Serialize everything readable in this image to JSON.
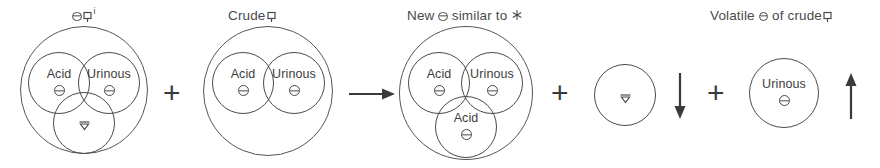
{
  "diagram": {
    "title_text": "Alchemical reaction of acid and urinous salts",
    "stroke_color": "#4a4a4a",
    "text_color": "#3c3c3c",
    "background": "#ffffff",
    "captions": [
      {
        "id": "caption-1",
        "prefix": "",
        "glyphs": "salt retort",
        "suffix": "",
        "superscript": "i",
        "text": ""
      },
      {
        "id": "caption-2",
        "prefix": "Crude",
        "glyphs": "retort",
        "suffix": "",
        "superscript": "",
        "text": "Crude"
      },
      {
        "id": "caption-3",
        "prefix": "New",
        "glyphs": "salt",
        "suffix": "similar to",
        "superscript": "",
        "text": "New  similar to"
      },
      {
        "id": "caption-4",
        "prefix": "Volatile",
        "glyphs": "salt",
        "suffix": "of crude",
        "superscript": "",
        "text": "Volatile  of crude"
      }
    ],
    "groups": [
      {
        "id": "group-1",
        "caption_id": "caption-1",
        "circles": [
          {
            "label": "Acid",
            "glyph": "salt"
          },
          {
            "label": "Urinous",
            "glyph": "salt"
          },
          {
            "label": "",
            "glyph": "vinegar"
          }
        ]
      },
      {
        "id": "group-2",
        "caption_id": "caption-2",
        "circles": [
          {
            "label": "Acid",
            "glyph": "salt"
          },
          {
            "label": "Urinous",
            "glyph": "salt"
          }
        ]
      },
      {
        "id": "group-3",
        "caption_id": "caption-3",
        "circles": [
          {
            "label": "Acid",
            "glyph": "salt"
          },
          {
            "label": "Urinous",
            "glyph": "salt"
          },
          {
            "label": "Acid",
            "glyph": "salt"
          }
        ]
      },
      {
        "id": "group-4",
        "caption_id": "",
        "circles": [
          {
            "label": "",
            "glyph": "vinegar"
          }
        ]
      },
      {
        "id": "group-5",
        "caption_id": "caption-4",
        "circles": [
          {
            "label": "Urinous",
            "glyph": "salt"
          }
        ]
      }
    ],
    "operators": [
      {
        "id": "op-plus-1",
        "kind": "plus",
        "symbol": "+"
      },
      {
        "id": "op-arrow-1",
        "kind": "arrow-right",
        "symbol": "→"
      },
      {
        "id": "op-plus-2",
        "kind": "plus",
        "symbol": "+"
      },
      {
        "id": "op-arrow-2",
        "kind": "arrow-down",
        "symbol": "↓"
      },
      {
        "id": "op-plus-3",
        "kind": "plus",
        "symbol": "+"
      },
      {
        "id": "op-arrow-3",
        "kind": "arrow-up",
        "symbol": "↑"
      }
    ],
    "labels": {
      "acid": "Acid",
      "urinous": "Urinous",
      "crude": "Crude",
      "new": "New",
      "similar_to": "similar to",
      "volatile": "Volatile",
      "of_crude": "of crude",
      "superscript_i": "i"
    }
  }
}
